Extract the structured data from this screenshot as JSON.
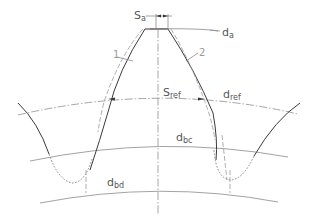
{
  "diagram": {
    "type": "gear tooth geometry",
    "labels": {
      "s_a": {
        "main": "S",
        "sub": "a"
      },
      "d_a": {
        "main": "d",
        "sub": "a"
      },
      "s_ref": {
        "main": "S",
        "sub": "ref"
      },
      "d_ref": {
        "main": "d",
        "sub": "ref"
      },
      "d_bc": {
        "main": "d",
        "sub": "bc"
      },
      "d_bd": {
        "main": "d",
        "sub": "bd"
      },
      "profile_1": "1",
      "profile_2": "2"
    },
    "colors": {
      "profile_line": "#3a3a3a",
      "circle_line": "#8a8a8a",
      "text": "#555555"
    }
  }
}
